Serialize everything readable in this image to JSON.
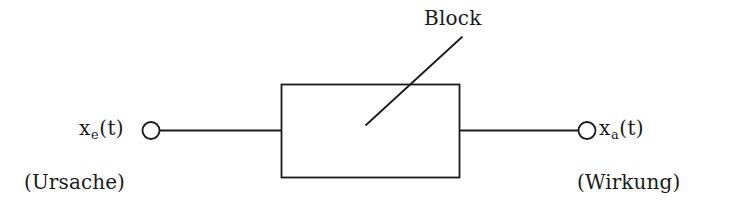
{
  "figure": {
    "kind": "block-diagram",
    "background_color": "#ffffff",
    "ink_color": "#1a1a1a",
    "width": 736,
    "height": 218
  },
  "callout": {
    "label": "Block",
    "leader_line": {
      "from_x": 462,
      "from_y": 37,
      "to_x": 366,
      "to_y": 125
    }
  },
  "block": {
    "x": 281,
    "y": 84,
    "width": 178,
    "height": 93,
    "fill": "none",
    "stroke": "#1a1a1a"
  },
  "input": {
    "signal_var": "x",
    "signal_subscript": "e",
    "signal_arg": "(t)",
    "annotation": "(Ursache)",
    "terminal": {
      "cx": 151,
      "cy": 130,
      "r": 8.5
    },
    "wire": {
      "x1": 160,
      "y1": 130,
      "x2": 281,
      "y2": 130
    }
  },
  "output": {
    "signal_var": "x",
    "signal_subscript": "a",
    "signal_arg": "(t)",
    "annotation": "(Wirkung)",
    "terminal": {
      "cx": 587,
      "cy": 130,
      "r": 8.5
    },
    "wire": {
      "x1": 459,
      "y1": 130,
      "x2": 578,
      "y2": 130
    }
  }
}
